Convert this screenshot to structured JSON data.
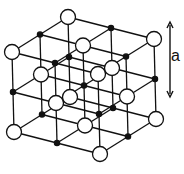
{
  "figure": {
    "dimension_label": "a",
    "colors": {
      "line": "#111111",
      "large_ion_fill": "#ffffff",
      "small_ion_fill": "#111111",
      "background": "#ffffff"
    },
    "projection": {
      "origin": [
        14,
        132
      ],
      "ex": [
        43,
        11
      ],
      "ey": [
        28,
        -17.5
      ],
      "ez": [
        -1,
        -40
      ]
    },
    "grid_size": 3,
    "large_ion_radius": 7.5,
    "small_ion_radius": 2.6,
    "arrow": {
      "x": 170,
      "y1": 22,
      "y2": 97
    }
  }
}
